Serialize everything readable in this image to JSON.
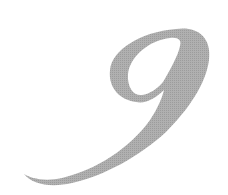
{
  "image": {
    "glyph": "9",
    "description": "Large decorative script numeral nine",
    "colors": {
      "background": "#ffffff",
      "glyph_fill": "#a9a9a9"
    }
  }
}
